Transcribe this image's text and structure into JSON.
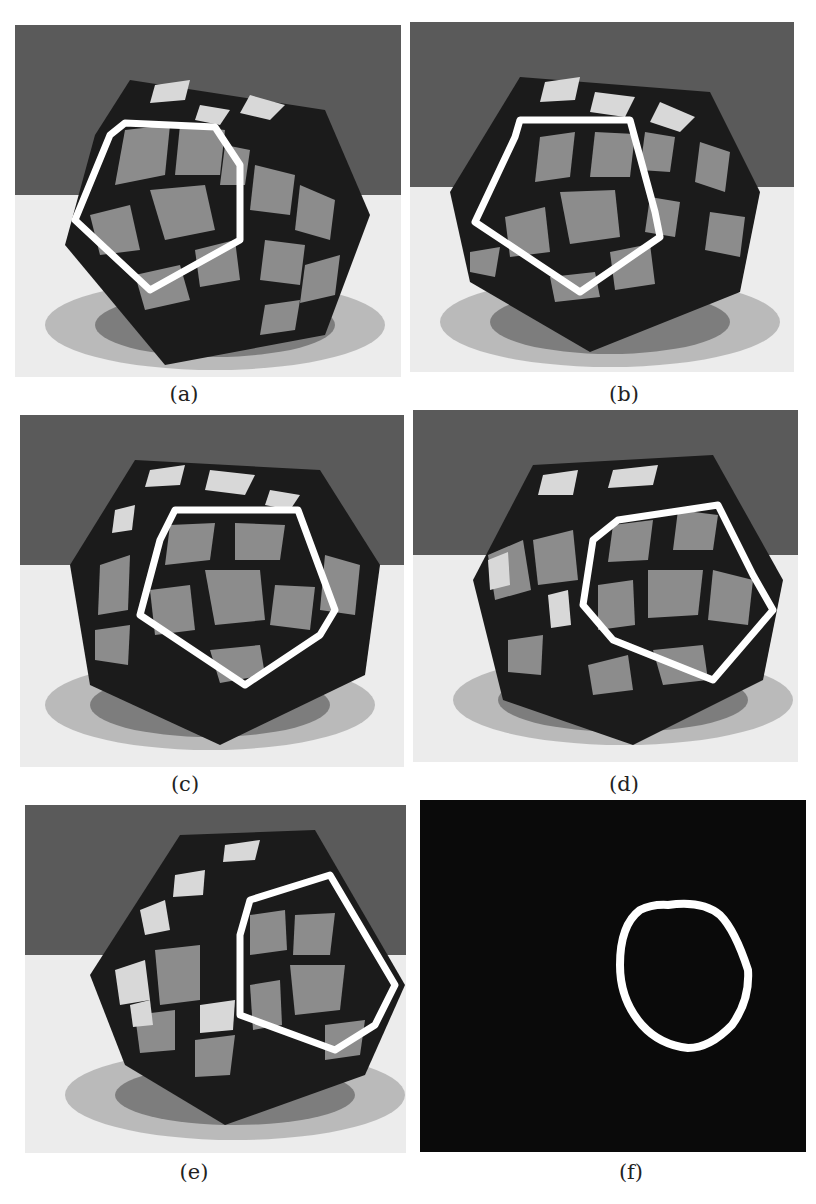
{
  "figure": {
    "panels": [
      {
        "id": "a",
        "caption": "(a)",
        "content": "megaminx photo with pentagon contour over front-left face"
      },
      {
        "id": "b",
        "caption": "(b)",
        "content": "megaminx photo with pentagon contour over front face"
      },
      {
        "id": "c",
        "caption": "(c)",
        "content": "megaminx photo with pentagon contour over center face"
      },
      {
        "id": "d",
        "caption": "(d)",
        "content": "megaminx photo with pentagon contour over front-right face"
      },
      {
        "id": "e",
        "caption": "(e)",
        "content": "megaminx photo with contour over right face"
      },
      {
        "id": "f",
        "caption": "(f)",
        "content": "black mask with white elliptical contour"
      }
    ],
    "colors": {
      "background_wall": "#5a5a5a",
      "table": "#e8e8e8",
      "contour": "#ffffff",
      "sticker": "#8c8c8c",
      "frame": "#1a1a1a",
      "mask": "#0a0a0a"
    }
  }
}
